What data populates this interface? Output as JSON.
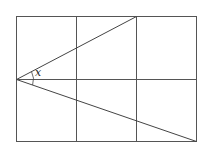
{
  "diagram": {
    "grid": {
      "columns": 3,
      "rows": 2,
      "left": 16,
      "top": 16,
      "right": 197,
      "bottom": 142,
      "vertical_lines_x": [
        16,
        76,
        136,
        197
      ],
      "horizontal_lines_y": [
        16,
        79,
        142
      ]
    },
    "apex": {
      "x": 16,
      "y": 79
    },
    "upper_ray_end": {
      "x": 136,
      "y": 16
    },
    "lower_ray_end": {
      "x": 197,
      "y": 142
    },
    "angle_label": "x",
    "colors": {
      "lines": "#555555",
      "background": "#ffffff"
    }
  }
}
